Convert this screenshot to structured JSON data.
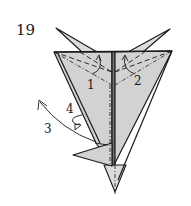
{
  "diagram": {
    "type": "origami-folding-step",
    "step_number": "19",
    "fold_labels": {
      "fold_1": "1",
      "fold_2": "2",
      "fold_3": "3",
      "fold_4": "4"
    },
    "colors": {
      "paper": "#d2d2d2",
      "line": "#1a1a1a",
      "background": "#ffffff"
    },
    "line_types": [
      "valley-fold (dashed)",
      "mountain-fold (dash-dot)",
      "edge (solid)"
    ],
    "arrows": [
      {
        "label": "1",
        "kind": "valley-fold-up"
      },
      {
        "label": "2",
        "kind": "valley-fold-up"
      },
      {
        "label": "3",
        "kind": "swing-flap-out"
      },
      {
        "label": "4",
        "kind": "turn-over-loop"
      }
    ]
  }
}
